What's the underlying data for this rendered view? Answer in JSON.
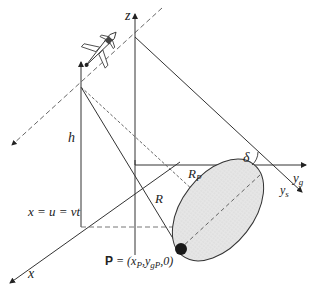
{
  "diagram": {
    "type": "sar-geometry",
    "labels": {
      "z_axis": "z",
      "x_axis": "x",
      "yg_axis": "y",
      "yg_sub": "g",
      "ys_axis": "y",
      "ys_sub": "s",
      "height": "h",
      "slant_range": "R",
      "range_to_p": "R",
      "range_to_p_sub": "P",
      "angle": "δ",
      "position_eq": "x = u = vt",
      "point_bold": "P",
      "point_eq": " = (x",
      "point_sub_p": "P",
      "point_mid": ",y",
      "point_sub_gp": "gP",
      "point_end": ",0)"
    },
    "colors": {
      "line": "#333333",
      "dashed": "#555555",
      "ellipse_fill": "#e2e2e2",
      "target": "#1a1a1a"
    }
  }
}
